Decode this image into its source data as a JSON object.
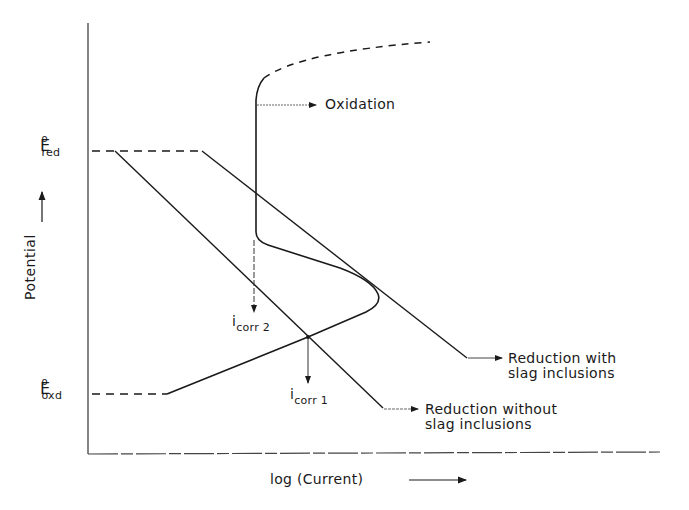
{
  "diagram": {
    "title": "",
    "y_axis_label": "Potential",
    "x_axis_label": "log (Current)",
    "levels": {
      "e_red": {
        "symbol": "E",
        "superscript": "o",
        "subscript": "red"
      },
      "e_oxd": {
        "symbol": "E",
        "superscript": "o",
        "subscript": "oxd"
      }
    },
    "curve_labels": {
      "oxidation": "Oxidation",
      "reduction_with_line1": "Reduction with",
      "reduction_with_line2": "slag inclusions",
      "reduction_without_line1": "Reduction without",
      "reduction_without_line2": "slag inclusions"
    },
    "currents": {
      "icorr2": {
        "symbol": "i",
        "subscript": "corr 2"
      },
      "icorr1": {
        "symbol": "i",
        "subscript": "corr 1"
      }
    },
    "colors": {
      "line": "#1a1a1a",
      "background": "#ffffff"
    }
  }
}
